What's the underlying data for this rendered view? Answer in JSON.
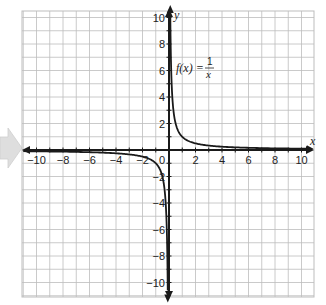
{
  "chart_data": {
    "type": "line",
    "title": "",
    "function_label": {
      "lhs": "f(x) =",
      "numerator": "1",
      "denominator": "x"
    },
    "xlabel": "x",
    "ylabel": "y",
    "xlim": [
      -11,
      11
    ],
    "ylim": [
      -11,
      10.7
    ],
    "grid": true,
    "x_ticks": [
      -10,
      -8,
      -6,
      -4,
      -2,
      2,
      4,
      6,
      8,
      10
    ],
    "y_ticks": [
      10,
      8,
      6,
      4,
      2,
      -2,
      -4,
      -6,
      -8,
      -10
    ],
    "origin_label": "0",
    "series": [
      {
        "name": "f(x) = 1/x, x>0",
        "x": [
          0.1,
          0.125,
          0.2,
          0.25,
          0.5,
          1,
          2,
          4,
          6,
          8,
          10.8
        ],
        "y": [
          10,
          8,
          5,
          4,
          2,
          1,
          0.5,
          0.25,
          0.167,
          0.125,
          0.093
        ]
      },
      {
        "name": "f(x) = 1/x, x<0",
        "x": [
          -11,
          -10,
          -8,
          -6,
          -4,
          -2,
          -1,
          -0.5,
          -0.25,
          -0.2,
          -0.125,
          -0.09
        ],
        "y": [
          -0.091,
          -0.1,
          -0.125,
          -0.167,
          -0.25,
          -0.5,
          -1,
          -2,
          -4,
          -5,
          -8,
          -11
        ]
      }
    ],
    "colors": {
      "grid": "#bdbdbd",
      "axis": "#1a1a1a",
      "curve": "#1a1a1a",
      "decor_arrow": "#dcdcdc"
    }
  }
}
